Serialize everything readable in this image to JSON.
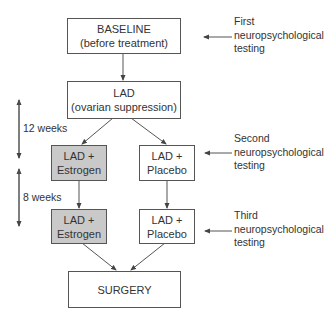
{
  "diagram": {
    "colors": {
      "line": "#555555",
      "box_border": "#555555",
      "shaded_fill": "#c9c9c9",
      "text": "#333333"
    },
    "nodes": {
      "baseline": {
        "line1": "BASELINE",
        "line2": "(before treatment)"
      },
      "lad": {
        "line1": "LAD",
        "line2": "(ovarian suppression)"
      },
      "estrogen_1": {
        "line1": "LAD +",
        "line2": "Estrogen"
      },
      "placebo_1": {
        "line1": "LAD +",
        "line2": "Placebo"
      },
      "estrogen_2": {
        "line1": "LAD +",
        "line2": "Estrogen"
      },
      "placebo_2": {
        "line1": "LAD +",
        "line2": "Placebo"
      },
      "surgery": {
        "line1": "SURGERY"
      }
    },
    "testing_labels": [
      {
        "line1": "First",
        "line2": "neuropsychological",
        "line3": "testing"
      },
      {
        "line1": "Second",
        "line2": "neuropsychological",
        "line3": "testing"
      },
      {
        "line1": "Third",
        "line2": "neuropsychological",
        "line3": "testing"
      }
    ],
    "durations": [
      {
        "label": "12 weeks"
      },
      {
        "label": "8 weeks"
      }
    ],
    "edges": [
      {
        "from": "baseline",
        "to": "lad"
      },
      {
        "from": "lad",
        "to": "estrogen_1"
      },
      {
        "from": "lad",
        "to": "placebo_1"
      },
      {
        "from": "estrogen_1",
        "to": "estrogen_2"
      },
      {
        "from": "placebo_1",
        "to": "placebo_2"
      },
      {
        "from": "estrogen_2",
        "to": "surgery"
      },
      {
        "from": "placebo_2",
        "to": "surgery"
      },
      {
        "from": "testing_label_1",
        "to": "baseline"
      },
      {
        "from": "testing_label_2",
        "to": "placebo_1"
      },
      {
        "from": "testing_label_3",
        "to": "placebo_2"
      }
    ]
  }
}
